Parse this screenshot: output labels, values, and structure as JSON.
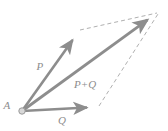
{
  "figure": {
    "kind": "vector-addition-parallelogram",
    "canvas": {
      "width": 168,
      "height": 131,
      "background": "#ffffff"
    },
    "colors": {
      "vector_stroke": "#8d8d8d",
      "dashed_stroke": "#b0b0b0",
      "label_text": "#8d8d8d",
      "point_fill": "#d8d8d8",
      "point_stroke": "#9a9a9a",
      "background": "#ffffff"
    },
    "origin": {
      "label": "A",
      "x": 22,
      "y": 111,
      "marker": "small-open-circle",
      "radius": 3.2
    },
    "vectors": [
      {
        "id": "p",
        "label": "P",
        "from_x": 22,
        "from_y": 111,
        "to_x": 79,
        "to_y": 31,
        "stroke_width": 2.6,
        "label_x": 40,
        "label_y": 66
      },
      {
        "id": "q",
        "label": "Q",
        "from_x": 22,
        "from_y": 111,
        "to_x": 98,
        "to_y": 107,
        "stroke_width": 2.6,
        "label_x": 62,
        "label_y": 120
      },
      {
        "id": "pq",
        "label": "P+Q",
        "from_x": 22,
        "from_y": 111,
        "to_x": 157,
        "to_y": 13,
        "stroke_width": 2.8,
        "label_x": 85,
        "label_y": 84
      }
    ],
    "dashed_edges": [
      {
        "id": "p-to-corner",
        "from_x": 80,
        "from_y": 30,
        "to_x": 157,
        "to_y": 13,
        "dash": "4 3",
        "stroke_width": 1
      },
      {
        "id": "q-to-corner",
        "from_x": 99,
        "from_y": 106,
        "to_x": 158,
        "to_y": 14,
        "dash": "4 3",
        "stroke_width": 1
      }
    ],
    "labels": {
      "origin": "A",
      "p": "P",
      "q": "Q",
      "resultant": "P+Q"
    }
  }
}
